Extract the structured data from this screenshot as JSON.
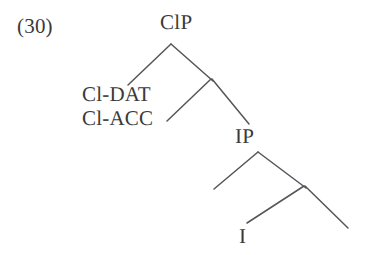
{
  "figure": {
    "example_number": "(30)",
    "type": "syntax-tree",
    "colors": {
      "background": "#ffffff",
      "text": "#3a3a3a",
      "branch_line": "#55555a"
    }
  },
  "tree": {
    "nodes": [
      {
        "id": "clp",
        "label": "ClP",
        "x": 177,
        "y": 23,
        "role": "root-node"
      },
      {
        "id": "cl-dat",
        "label": "Cl-DAT",
        "x": 113,
        "y": 94,
        "role": "specifier-label"
      },
      {
        "id": "cl-acc",
        "label": "Cl-ACC",
        "x": 113,
        "y": 118,
        "role": "specifier-label"
      },
      {
        "id": "ip",
        "label": "IP",
        "x": 245,
        "y": 137,
        "role": "complement-node"
      },
      {
        "id": "i",
        "label": "I",
        "x": 244,
        "y": 237,
        "role": "terminal-node"
      }
    ],
    "branches": [
      {
        "from": "clp",
        "to": "cl-dat-site",
        "x1": 171,
        "y1": 44,
        "x2": 128,
        "y2": 85
      },
      {
        "from": "clp",
        "to": "cl-junction",
        "x1": 171,
        "y1": 44,
        "x2": 213,
        "y2": 81
      },
      {
        "from": "cl-junction",
        "to": "cl-acc-site",
        "x1": 211,
        "y1": 79,
        "x2": 167,
        "y2": 121
      },
      {
        "from": "cl-junction",
        "to": "ip",
        "x1": 212,
        "y1": 79,
        "x2": 249,
        "y2": 124
      },
      {
        "from": "ip",
        "to": "ip-spec-site",
        "x1": 258,
        "y1": 152,
        "x2": 214,
        "y2": 189
      },
      {
        "from": "ip",
        "to": "i-junction",
        "x1": 258,
        "y1": 152,
        "x2": 306,
        "y2": 188
      },
      {
        "from": "i-junction",
        "to": "i",
        "x1": 304,
        "y1": 186,
        "x2": 247,
        "y2": 223
      },
      {
        "from": "i-junction",
        "to": "vp-site",
        "x1": 305,
        "y1": 186,
        "x2": 348,
        "y2": 228
      }
    ]
  }
}
